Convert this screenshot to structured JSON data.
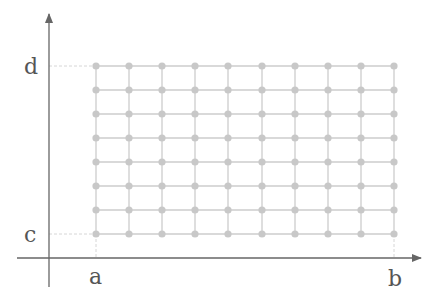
{
  "diagram": {
    "type": "rectangular grid partition",
    "labels": {
      "x_left": "a",
      "x_right": "b",
      "y_bottom": "c",
      "y_top": "d"
    },
    "grid": {
      "columns": 10,
      "rows": 8,
      "x_positions": [
        96,
        129,
        162,
        195,
        228,
        262,
        295,
        328,
        361,
        394
      ],
      "y_positions": [
        66,
        90,
        114,
        138,
        162,
        186,
        210,
        234
      ]
    },
    "colors": {
      "axis": "#666666",
      "grid_line": "#cccccc",
      "grid_point": "#c8c8c8",
      "guide": "#d6d6d6",
      "label": "#555555"
    }
  }
}
